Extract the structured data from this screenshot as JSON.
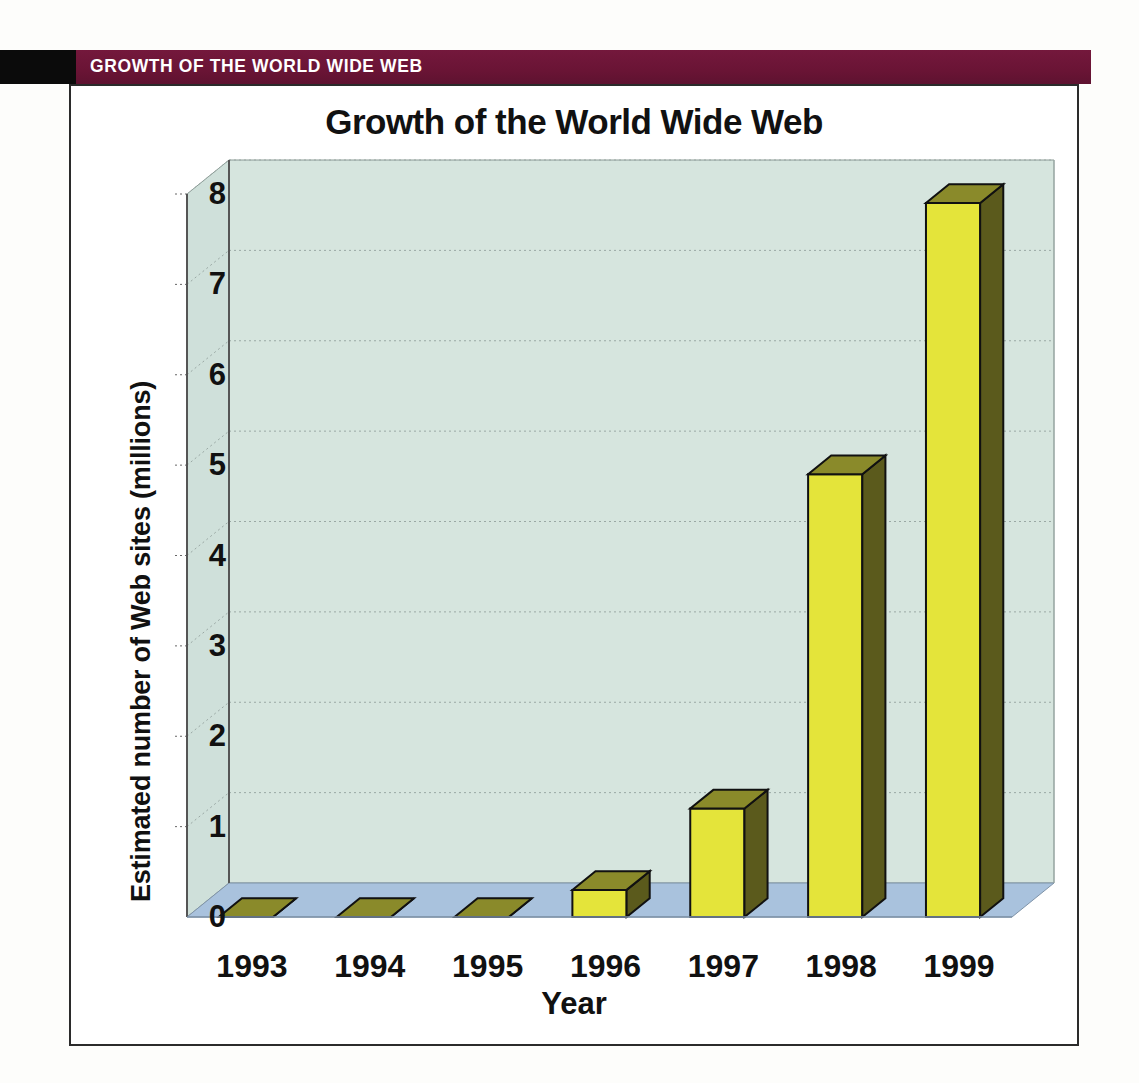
{
  "header": {
    "banner_label": "GROWTH OF THE WORLD WIDE WEB",
    "banner_color": "#6e1638",
    "block_color": "#0b0b0b"
  },
  "chart_data": {
    "type": "bar",
    "title": "Growth of the World Wide Web",
    "xlabel": "Year",
    "ylabel": "Estimated number of Web sites (millions)",
    "categories": [
      "1993",
      "1994",
      "1995",
      "1996",
      "1997",
      "1998",
      "1999"
    ],
    "values": [
      0.0,
      0.0,
      0.0,
      0.3,
      1.2,
      4.9,
      7.9
    ],
    "ylim": [
      0,
      8
    ],
    "ytick_labels": [
      "0",
      "1",
      "2",
      "3",
      "4",
      "5",
      "6",
      "7",
      "8"
    ],
    "grid": true,
    "legend": "none",
    "style": "3d-column",
    "bar_front_color": "#e4e43a",
    "bar_side_color": "#5b5a1c",
    "bar_top_color": "#8a8a2a",
    "wall_color": "#d6e5de",
    "floor_color": "#a9c2dd",
    "axis_color": "#555555"
  }
}
